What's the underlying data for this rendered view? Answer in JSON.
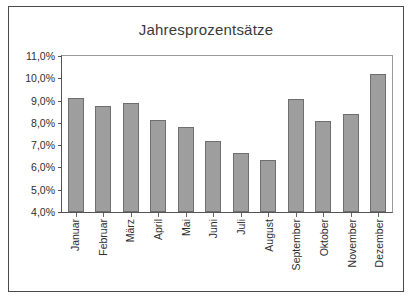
{
  "chart_data": {
    "type": "bar",
    "title": "Jahresprozentsätze",
    "xlabel": "",
    "ylabel": "",
    "grid": false,
    "legend": "none",
    "ylim": [
      4.0,
      11.0
    ],
    "ytick_step": 1.0,
    "ytick_labels": [
      "11,0%",
      "10,0%",
      "9,0%",
      "8,0%",
      "7,0%",
      "6,0%",
      "5,0%",
      "4,0%"
    ],
    "ytick_values": [
      11.0,
      10.0,
      9.0,
      8.0,
      7.0,
      6.0,
      5.0,
      4.0
    ],
    "categories": [
      "Januar",
      "Februar",
      "März",
      "April",
      "Mai",
      "Juni",
      "Juli",
      "August",
      "September",
      "Oktober",
      "November",
      "Dezember"
    ],
    "values": [
      9.1,
      8.75,
      8.9,
      8.15,
      7.8,
      7.2,
      6.65,
      6.35,
      9.05,
      8.1,
      8.4,
      10.2
    ],
    "value_labels": [
      "9,1%",
      "8,75%",
      "8,9%",
      "8,15%",
      "7,8%",
      "7,2%",
      "6,65%",
      "6,35%",
      "9,05%",
      "8,1%",
      "8,4%",
      "10,2%"
    ],
    "bar_color": "#9e9e9e",
    "bar_border_color": "#6f6f6f",
    "axis_color": "#555555",
    "text_color": "#2e2e2e",
    "background": "#ffffff"
  }
}
